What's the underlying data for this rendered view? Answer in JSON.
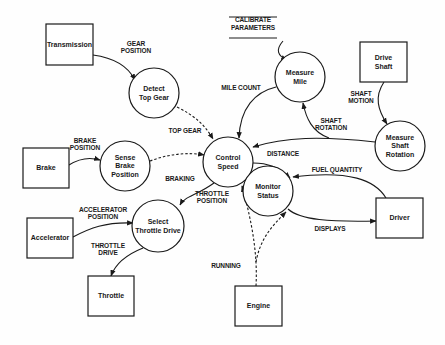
{
  "diagram": {
    "type": "data-flow-diagram",
    "colors": {
      "ink": "#1a1a1a",
      "background": "#fefefe"
    },
    "externals": [
      {
        "id": "transmission",
        "label": [
          "Transmission"
        ],
        "x": 46,
        "y": 24,
        "w": 47,
        "h": 41
      },
      {
        "id": "drive-shaft",
        "label": [
          "Drive",
          "Shaft"
        ],
        "x": 360,
        "y": 42,
        "w": 47,
        "h": 40
      },
      {
        "id": "brake",
        "label": [
          "Brake"
        ],
        "x": 23,
        "y": 148,
        "w": 46,
        "h": 40
      },
      {
        "id": "driver",
        "label": [
          "Driver"
        ],
        "x": 376,
        "y": 198,
        "w": 47,
        "h": 40
      },
      {
        "id": "accelerator",
        "label": [
          "Accelerator"
        ],
        "x": 27,
        "y": 218,
        "w": 46,
        "h": 40
      },
      {
        "id": "throttle",
        "label": [
          "Throttle"
        ],
        "x": 88,
        "y": 276,
        "w": 46,
        "h": 40
      },
      {
        "id": "engine",
        "label": [
          "Engine"
        ],
        "x": 235,
        "y": 286,
        "w": 47,
        "h": 40
      }
    ],
    "processes": [
      {
        "id": "detect-top-gear",
        "label": [
          "Detect",
          "Top Gear"
        ],
        "cx": 154,
        "cy": 93,
        "r": 25
      },
      {
        "id": "measure-mile",
        "label": [
          "Measure",
          "Mile"
        ],
        "cx": 300,
        "cy": 77,
        "r": 25
      },
      {
        "id": "measure-shaft-rotation",
        "label": [
          "Measure",
          "Shaft",
          "Rotation"
        ],
        "cx": 400,
        "cy": 146,
        "r": 25
      },
      {
        "id": "control-speed",
        "label": [
          "Control",
          "Speed"
        ],
        "cx": 228,
        "cy": 162,
        "r": 25
      },
      {
        "id": "sense-brake-position",
        "label": [
          "Sense",
          "Brake",
          "Position"
        ],
        "cx": 125,
        "cy": 166,
        "r": 25
      },
      {
        "id": "monitor-status",
        "label": [
          "Monitor",
          "Status"
        ],
        "cx": 268,
        "cy": 191,
        "r": 25
      },
      {
        "id": "select-throttle-drive",
        "label": [
          "Select",
          "Throttle  Drive"
        ],
        "cx": 158,
        "cy": 226,
        "r": 26
      }
    ],
    "stores": [
      {
        "id": "calibrate-parameters",
        "label": [
          "CALIBRATE",
          "PARAMETERS"
        ],
        "x": 253,
        "y": 24
      }
    ],
    "flows": [
      {
        "id": "gear-position",
        "label": [
          "GEAR",
          "POSITION"
        ],
        "lx": 136,
        "ly": 47,
        "dashed": false,
        "d": "M93,55 C115,58 128,66 135,80",
        "ax": 135,
        "ay": 80
      },
      {
        "id": "top-gear",
        "label": [
          "TOP GEAR"
        ],
        "lx": 185,
        "ly": 131,
        "dashed": true,
        "d": "M177,107 C195,116 205,125 213,139",
        "ax": 213,
        "ay": 139
      },
      {
        "id": "mile-count",
        "label": [
          "MILE COUNT"
        ],
        "lx": 241,
        "ly": 88,
        "dashed": false,
        "d": "M276,87 C255,92 240,108 239,138",
        "ax": 239,
        "ay": 138
      },
      {
        "id": "calibrate-flow",
        "label": [],
        "lx": 0,
        "ly": 0,
        "dashed": false,
        "d": "M283,41 C275,50 278,56 287,60",
        "ax": 287,
        "ay": 60
      },
      {
        "id": "shaft-motion",
        "label": [
          "SHAFT",
          "MOTION"
        ],
        "lx": 361,
        "ly": 97,
        "dashed": false,
        "d": "M384,82 C374,97 378,110 387,124",
        "ax": 387,
        "ay": 124
      },
      {
        "id": "shaft-rotation",
        "label": [
          "SHAFT",
          "ROTATION"
        ],
        "lx": 331,
        "ly": 124,
        "dashed": false,
        "d": "M375,142 C320,136 285,137 253,147",
        "ax": 253,
        "ay": 147
      },
      {
        "id": "shaft-rotation-branch",
        "label": [],
        "lx": 0,
        "ly": 0,
        "dashed": false,
        "d": "M329,138 C312,132 306,118 303,103",
        "ax": 303,
        "ay": 103
      },
      {
        "id": "braking",
        "label": [
          "BRAKING"
        ],
        "lx": 180,
        "ly": 179,
        "dashed": true,
        "d": "M150,161 C168,154 188,152 204,155",
        "ax": 204,
        "ay": 155
      },
      {
        "id": "brake-position",
        "label": [
          "BRAKE",
          "POSITION"
        ],
        "lx": 85,
        "ly": 144,
        "dashed": false,
        "d": "M69,165 C80,158 90,157 100,160",
        "ax": 100,
        "ay": 160
      },
      {
        "id": "distance",
        "label": [
          "DISTANCE"
        ],
        "lx": 283,
        "ly": 154,
        "dashed": false,
        "d": "M253,163 C268,163 278,167 290,178",
        "ax": 290,
        "ay": 178
      },
      {
        "id": "fuel-quantity",
        "label": [
          "FUEL QUANTITY"
        ],
        "lx": 337,
        "ly": 170,
        "dashed": false,
        "d": "M386,198 C375,180 350,170 293,177",
        "ax": 293,
        "ay": 177
      },
      {
        "id": "displays",
        "label": [
          "DISPLAYS"
        ],
        "lx": 330,
        "ly": 229,
        "dashed": false,
        "d": "M288,209 C300,220 330,222 376,221",
        "ax": 376,
        "ay": 221
      },
      {
        "id": "throttle-position",
        "label": [
          "THROTTLE",
          "POSITION"
        ],
        "lx": 212,
        "ly": 197,
        "dashed": false,
        "d": "M214,183 C196,196 185,196 180,205",
        "ax": 180,
        "ay": 205
      },
      {
        "id": "accelerator-position",
        "label": [
          "ACCELERATOR",
          "POSITION"
        ],
        "lx": 103,
        "ly": 213,
        "dashed": false,
        "d": "M73,237 C90,228 105,222 133,223",
        "ax": 133,
        "ay": 223
      },
      {
        "id": "throttle-drive",
        "label": [
          "THROTTLE",
          "DRIVE"
        ],
        "lx": 108,
        "ly": 249,
        "dashed": false,
        "d": "M143,248 C128,254 116,262 111,276",
        "ax": 111,
        "ay": 276
      },
      {
        "id": "running-to-control",
        "label": [
          "RUNNING"
        ],
        "lx": 226,
        "ly": 266,
        "dashed": true,
        "d": "M256,286 C258,250 250,215 242,186",
        "ax": 242,
        "ay": 186
      },
      {
        "id": "running-to-monitor",
        "label": [],
        "lx": 0,
        "ly": 0,
        "dashed": true,
        "d": "M256,262 C260,240 270,228 286,212",
        "ax": 286,
        "ay": 212
      }
    ]
  }
}
